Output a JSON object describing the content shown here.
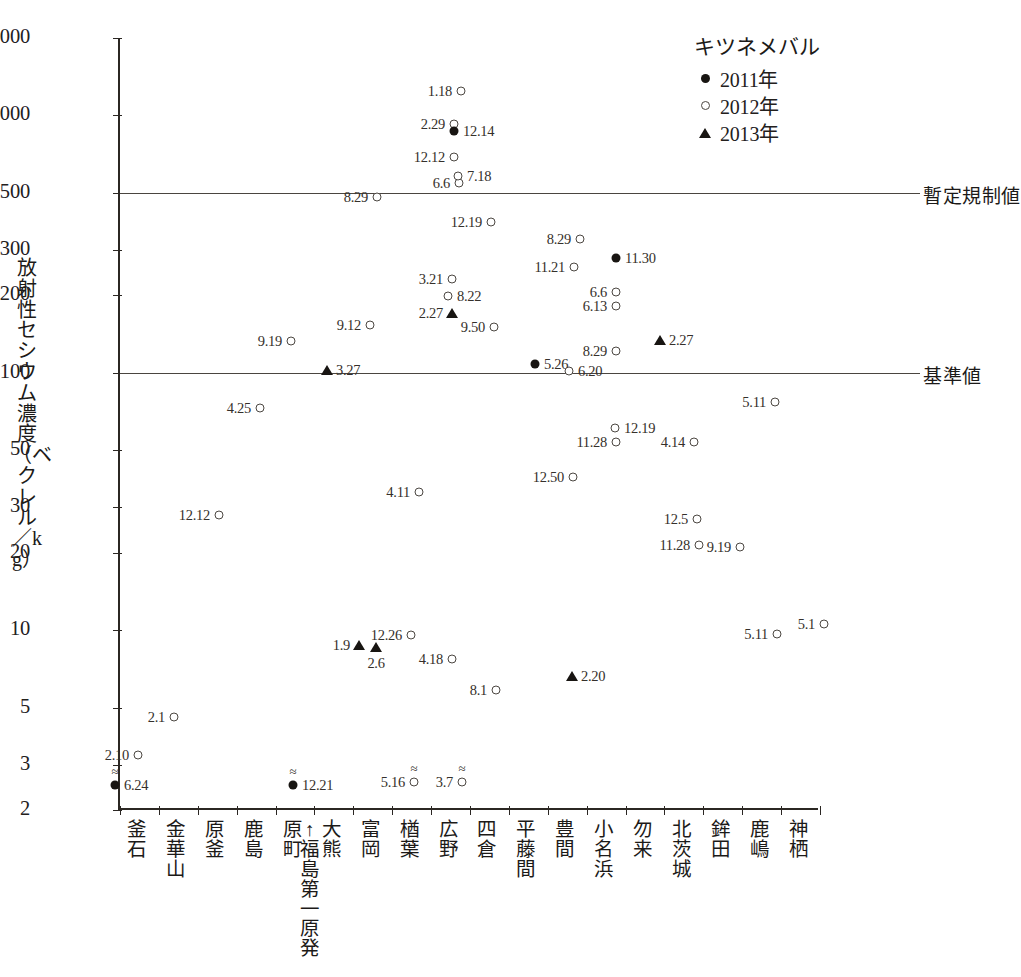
{
  "legend": {
    "title": "キツネメバル",
    "entries": [
      {
        "symbol": "filled-circle",
        "label": "2011年"
      },
      {
        "symbol": "open-circle",
        "label": "2012年"
      },
      {
        "symbol": "filled-triangle",
        "label": "2013年"
      }
    ]
  },
  "axes": {
    "y_caption": "放射性セシウム濃度（ベクレル／kg）",
    "y_ticks": [
      "2,000",
      "1,000",
      "500",
      "300",
      "200",
      "100",
      "50",
      "30",
      "20",
      "10",
      "5",
      "3",
      "2"
    ]
  },
  "thresholds": [
    {
      "label": "暫定規制値",
      "value": 500
    },
    {
      "label": "基準値",
      "value": 100
    }
  ],
  "x_categories": [
    "釜石",
    "金華山",
    "原釜",
    "鹿島",
    "原町",
    "大熊",
    "富岡",
    "楢葉",
    "広野",
    "四倉",
    "平藤間",
    "豊間",
    "小名浜",
    "勿来",
    "北茨城",
    "鉾田",
    "鹿嶋",
    "神栖"
  ],
  "npp_annotation": "↑福島第一原発",
  "chart_data": {
    "type": "scatter",
    "title": "",
    "xlabel": "",
    "ylabel": "放射性セシウム濃度（ベクレル／kg）",
    "yscale": "log",
    "ylim": [
      2,
      2000
    ],
    "grid": false,
    "legend_position": "top-right",
    "categories": [
      "釜石",
      "金華山",
      "原釜",
      "鹿島",
      "原町",
      "大熊",
      "富岡",
      "楢葉",
      "広野",
      "四倉",
      "平藤間",
      "豊間",
      "小名浜",
      "勿来",
      "北茨城",
      "鉾田",
      "鹿嶋",
      "神栖"
    ],
    "series": [
      {
        "name": "2011年",
        "symbol": "filled-circle"
      },
      {
        "name": "2012年",
        "symbol": "open-circle"
      },
      {
        "name": "2013年",
        "symbol": "filled-triangle"
      }
    ],
    "reference_lines": [
      {
        "label": "暫定規制値",
        "y": 500
      },
      {
        "label": "基準値",
        "y": 100
      }
    ],
    "points": [
      {
        "label": "6.24",
        "series": "2011年",
        "x_px": 113,
        "y_px": 785,
        "value": 2.6,
        "category": "釜石",
        "label_pos": "right",
        "approx": true
      },
      {
        "label": "2.10",
        "series": "2012年",
        "x_px": 136,
        "y_px": 755,
        "value": 3.4,
        "category": "釜石",
        "label_pos": "left"
      },
      {
        "label": "2.1",
        "series": "2012年",
        "x_px": 172,
        "y_px": 717,
        "value": 4.6,
        "category": "金華山",
        "label_pos": "left"
      },
      {
        "label": "4.25",
        "series": "2012年",
        "x_px": 258,
        "y_px": 408,
        "value": 72,
        "category": "原釜",
        "label_pos": "left"
      },
      {
        "label": "12.12",
        "series": "2012年",
        "x_px": 217,
        "y_px": 515,
        "value": 30,
        "category": "原釜",
        "label_pos": "left"
      },
      {
        "label": "9.19",
        "series": "2012年",
        "x_px": 289,
        "y_px": 341,
        "value": 125,
        "category": "鹿島",
        "label_pos": "left"
      },
      {
        "label": "12.21",
        "series": "2011年",
        "x_px": 291,
        "y_px": 785,
        "value": 2.6,
        "category": "原町",
        "label_pos": "right",
        "approx": true
      },
      {
        "label": "3.27",
        "series": "2013年",
        "x_px": 325,
        "y_px": 370,
        "value": 108,
        "category": "大熊",
        "label_pos": "right"
      },
      {
        "label": "1.9",
        "series": "2013年",
        "x_px": 357,
        "y_px": 645,
        "value": 9.3,
        "category": "大熊",
        "label_pos": "left"
      },
      {
        "label": "9.12",
        "series": "2012年",
        "x_px": 368,
        "y_px": 325,
        "value": 150,
        "category": "富岡",
        "label_pos": "left"
      },
      {
        "label": "8.29",
        "series": "2012年",
        "x_px": 375,
        "y_px": 197,
        "value": 500,
        "category": "富岡",
        "label_pos": "left"
      },
      {
        "label": "2.6",
        "series": "2013年",
        "x_px": 374,
        "y_px": 647,
        "value": 9.2,
        "category": "富岡",
        "label_pos": "below"
      },
      {
        "label": "12.26",
        "series": "2012年",
        "x_px": 409,
        "y_px": 635,
        "value": 10.3,
        "category": "富岡",
        "label_pos": "left"
      },
      {
        "label": "4.11",
        "series": "2012年",
        "x_px": 417,
        "y_px": 492,
        "value": 36,
        "category": "楢葉",
        "label_pos": "left"
      },
      {
        "label": "5.16",
        "series": "2012年",
        "x_px": 412,
        "y_px": 782,
        "value": 2.65,
        "category": "楢葉",
        "label_pos": "left",
        "approx": true
      },
      {
        "label": "4.18",
        "series": "2012年",
        "x_px": 450,
        "y_px": 659,
        "value": 8.2,
        "category": "楢葉",
        "label_pos": "left"
      },
      {
        "label": "2.27",
        "series": "2013年",
        "x_px": 450,
        "y_px": 313,
        "value": 175,
        "category": "楢葉",
        "label_pos": "left"
      },
      {
        "label": "3.21",
        "series": "2012年",
        "x_px": 450,
        "y_px": 279,
        "value": 225,
        "category": "楢葉",
        "label_pos": "left"
      },
      {
        "label": "8.22",
        "series": "2012年",
        "x_px": 446,
        "y_px": 296,
        "value": 200,
        "category": "楢葉",
        "label_pos": "right"
      },
      {
        "label": "12.12",
        "series": "2012年",
        "x_px": 452,
        "y_px": 157,
        "value": 700,
        "category": "楢葉",
        "label_pos": "left"
      },
      {
        "label": "2.29",
        "series": "2012年",
        "x_px": 452,
        "y_px": 124,
        "value": 950,
        "category": "楢葉",
        "label_pos": "left"
      },
      {
        "label": "1.18",
        "series": "2012年",
        "x_px": 459,
        "y_px": 91,
        "value": 1350,
        "category": "楢葉",
        "label_pos": "left"
      },
      {
        "label": "12.14",
        "series": "2011年",
        "x_px": 452,
        "y_px": 131,
        "value": 880,
        "category": "楢葉",
        "label_pos": "right"
      },
      {
        "label": "6.6",
        "series": "2012年",
        "x_px": 457,
        "y_px": 183,
        "value": 560,
        "category": "広野",
        "label_pos": "left"
      },
      {
        "label": "7.18",
        "series": "2012年",
        "x_px": 456,
        "y_px": 176,
        "value": 600,
        "category": "広野",
        "label_pos": "right"
      },
      {
        "label": "12.19",
        "series": "2012年",
        "x_px": 489,
        "y_px": 222,
        "value": 395,
        "category": "広野",
        "label_pos": "left"
      },
      {
        "label": "9.50",
        "series": "2012年",
        "x_px": 492,
        "y_px": 327,
        "value": 148,
        "category": "広野",
        "label_pos": "left"
      },
      {
        "label": "3.7",
        "series": "2012年",
        "x_px": 460,
        "y_px": 782,
        "value": 2.65,
        "category": "広野",
        "label_pos": "left",
        "approx": true
      },
      {
        "label": "8.1",
        "series": "2012年",
        "x_px": 494,
        "y_px": 690,
        "value": 6.5,
        "category": "四倉",
        "label_pos": "left"
      },
      {
        "label": "5.26",
        "series": "2011年",
        "x_px": 533,
        "y_px": 364,
        "value": 120,
        "category": "平藤間",
        "label_pos": "right"
      },
      {
        "label": "11.21",
        "series": "2012年",
        "x_px": 572,
        "y_px": 267,
        "value": 245,
        "category": "平藤間",
        "label_pos": "left"
      },
      {
        "label": "8.29",
        "series": "2012年",
        "x_px": 578,
        "y_px": 239,
        "value": 305,
        "category": "平藤間",
        "label_pos": "left"
      },
      {
        "label": "12.50",
        "series": "2012年",
        "x_px": 571,
        "y_px": 477,
        "value": 47,
        "category": "平藤間",
        "label_pos": "left"
      },
      {
        "label": "2.20",
        "series": "2013年",
        "x_px": 570,
        "y_px": 676,
        "value": 7.3,
        "category": "豊間",
        "label_pos": "right"
      },
      {
        "label": "6.20",
        "series": "2012年",
        "x_px": 567,
        "y_px": 371,
        "value": 105,
        "category": "小名浜",
        "label_pos": "right"
      },
      {
        "label": "8.29",
        "series": "2012年",
        "x_px": 614,
        "y_px": 351,
        "value": 125,
        "category": "小名浜",
        "label_pos": "left"
      },
      {
        "label": "6.13",
        "series": "2012年",
        "x_px": 614,
        "y_px": 306,
        "value": 185,
        "category": "小名浜",
        "label_pos": "left"
      },
      {
        "label": "6.6",
        "series": "2012年",
        "x_px": 614,
        "y_px": 292,
        "value": 205,
        "category": "小名浜",
        "label_pos": "left"
      },
      {
        "label": "11.30",
        "series": "2011年",
        "x_px": 614,
        "y_px": 258,
        "value": 295,
        "category": "小名浜",
        "label_pos": "right"
      },
      {
        "label": "11.28",
        "series": "2012年",
        "x_px": 614,
        "y_px": 442,
        "value": 57,
        "category": "小名浜",
        "label_pos": "left"
      },
      {
        "label": "12.19",
        "series": "2012年",
        "x_px": 613,
        "y_px": 428,
        "value": 62,
        "category": "小名浜",
        "label_pos": "right"
      },
      {
        "label": "4.14",
        "series": "2012年",
        "x_px": 692,
        "y_px": 442,
        "value": 57,
        "category": "勿来",
        "label_pos": "left"
      },
      {
        "label": "2.27",
        "series": "2013年",
        "x_px": 658,
        "y_px": 340,
        "value": 140,
        "category": "勿来",
        "label_pos": "right"
      },
      {
        "label": "12.5",
        "series": "2012年",
        "x_px": 695,
        "y_px": 519,
        "value": 28,
        "category": "北茨城",
        "label_pos": "left"
      },
      {
        "label": "11.28",
        "series": "2012年",
        "x_px": 697,
        "y_px": 545,
        "value": 23,
        "category": "北茨城",
        "label_pos": "left"
      },
      {
        "label": "9.19",
        "series": "2012年",
        "x_px": 738,
        "y_px": 547,
        "value": 22.5,
        "category": "鉾田",
        "label_pos": "left"
      },
      {
        "label": "5.11",
        "series": "2012年",
        "x_px": 773,
        "y_px": 402,
        "value": 76,
        "category": "鉾田",
        "label_pos": "left"
      },
      {
        "label": "5.11",
        "series": "2012年",
        "x_px": 775,
        "y_px": 634,
        "value": 10.2,
        "category": "鹿嶋",
        "label_pos": "left"
      },
      {
        "label": "5.1",
        "series": "2012年",
        "x_px": 822,
        "y_px": 624,
        "value": 11.2,
        "category": "神栖",
        "label_pos": "left"
      }
    ]
  }
}
